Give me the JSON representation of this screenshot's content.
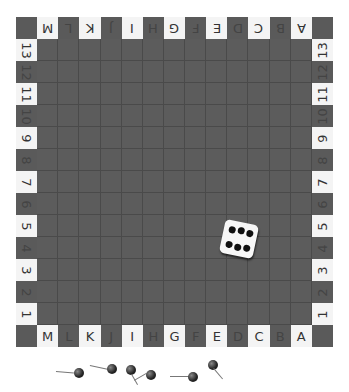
{
  "board": {
    "top_letters": [
      "M",
      "L",
      "K",
      "J",
      "I",
      "H",
      "G",
      "F",
      "E",
      "D",
      "C",
      "B",
      "A"
    ],
    "bottom_letters": [
      "M",
      "L",
      "K",
      "J",
      "I",
      "H",
      "G",
      "F",
      "E",
      "D",
      "C",
      "B",
      "A"
    ],
    "left_numbers": [
      "13",
      "12",
      "11",
      "10",
      "9",
      "8",
      "7",
      "6",
      "5",
      "4",
      "3",
      "2",
      "1"
    ],
    "right_numbers": [
      "13",
      "12",
      "11",
      "10",
      "9",
      "8",
      "7",
      "6",
      "5",
      "4",
      "3",
      "2",
      "1"
    ],
    "grid_size": 13,
    "colors": {
      "grid": "#5c5c5c",
      "label_light": "#f4f4f4",
      "label_dark": "#5a5a5a"
    }
  },
  "die": {
    "face_value": 6
  },
  "pins": {
    "count": 6
  }
}
